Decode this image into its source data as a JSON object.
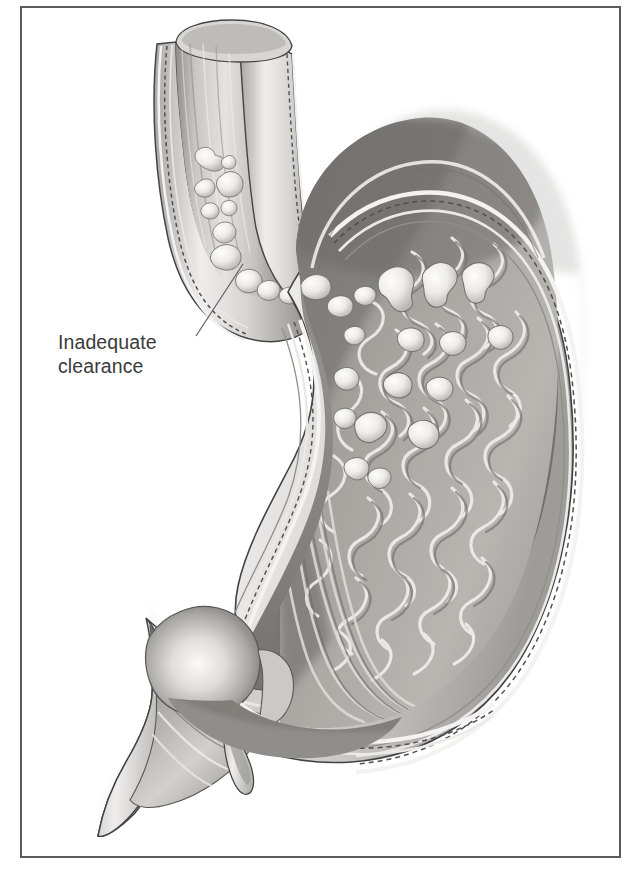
{
  "figure": {
    "domain": "medical-illustration",
    "style": "grayscale pencil / airbrush anatomical drawing",
    "border_color": "#55565a",
    "background_color": "#ffffff"
  },
  "annotations": [
    {
      "id": "inadequate-clearance",
      "text": "Inadequate\nclearance",
      "line1": "Inadequate",
      "line2": "clearance",
      "text_color": "#3a3a3c",
      "font_size_px": 19.5,
      "text_x": 58,
      "text_y": 330,
      "leader_line": {
        "from_x": 196,
        "from_y": 336,
        "to_x": 243,
        "to_y": 264,
        "color": "#5a5a5e",
        "width_px": 1.2
      },
      "points_to": "refluxate material in distal esophagus above the cardia"
    }
  ],
  "anatomy": {
    "structures": [
      {
        "name": "esophagus",
        "description": "cut tube entering upper left, wall layers visible, lumen contains refluxate"
      },
      {
        "name": "esophagus-cut-end",
        "description": "rounded open top end with vertical mucosal striations"
      },
      {
        "name": "gastroesophageal-junction",
        "description": "cardia where esophagus meets stomach"
      },
      {
        "name": "fundus",
        "description": "dark domed upper stomach chamber"
      },
      {
        "name": "body-of-stomach",
        "description": "large cavity lined with rugae"
      },
      {
        "name": "rugae",
        "description": "serpentine light gastric mucosal folds covering right inner wall"
      },
      {
        "name": "lesser-curvature",
        "description": "concave left inner margin of stomach"
      },
      {
        "name": "greater-curvature",
        "description": "convex right outer margin of stomach"
      },
      {
        "name": "antrum",
        "description": "lower tapering stomach segment with longitudinal folds"
      },
      {
        "name": "pylorus",
        "description": "rounded pyloric sphincter bulge at lower left"
      },
      {
        "name": "duodenal-bulb",
        "description": "cut duodenum continuing left with radiating folds and small tail"
      },
      {
        "name": "refluxate-blobs",
        "description": "light irregular chunks of regurgitated gastric content in esophagus and on gastric mucosa"
      },
      {
        "name": "serosa-layer",
        "description": "thin pale outer wall line"
      },
      {
        "name": "muscularis-layer",
        "description": "dashed/stippled dark band within the wall"
      }
    ],
    "palette": {
      "outline": "#3c3c3e",
      "wall_light": "#f2f0ee",
      "wall_mid": "#b9b7b4",
      "mucosa_mid": "#9b9996",
      "mucosa_dark": "#6f6d6b",
      "fundus_shadow": "#5d5b59",
      "rugae_highlight": "#efeeec",
      "reflux_highlight": "#fbfaf8"
    }
  }
}
